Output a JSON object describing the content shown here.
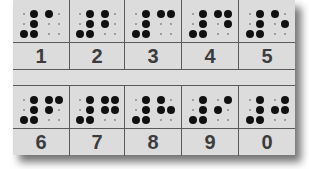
{
  "card": {
    "background": "#dcdcdc",
    "line_color": "#5a5a5a",
    "dot_color": "#111111",
    "numeral_color": "#3c3c3c"
  },
  "number_sign": [
    3,
    4,
    5,
    6
  ],
  "rows": [
    {
      "cells": [
        {
          "numeral": "1",
          "dots": [
            1
          ]
        },
        {
          "numeral": "2",
          "dots": [
            1,
            2
          ]
        },
        {
          "numeral": "3",
          "dots": [
            1,
            4
          ]
        },
        {
          "numeral": "4",
          "dots": [
            1,
            4,
            5
          ]
        },
        {
          "numeral": "5",
          "dots": [
            1,
            5
          ]
        }
      ]
    },
    {
      "cells": [
        {
          "numeral": "6",
          "dots": [
            1,
            2,
            4
          ]
        },
        {
          "numeral": "7",
          "dots": [
            1,
            2,
            4,
            5
          ]
        },
        {
          "numeral": "8",
          "dots": [
            1,
            2,
            5
          ]
        },
        {
          "numeral": "9",
          "dots": [
            2,
            4
          ]
        },
        {
          "numeral": "0",
          "dots": [
            2,
            4,
            5
          ]
        }
      ]
    }
  ]
}
